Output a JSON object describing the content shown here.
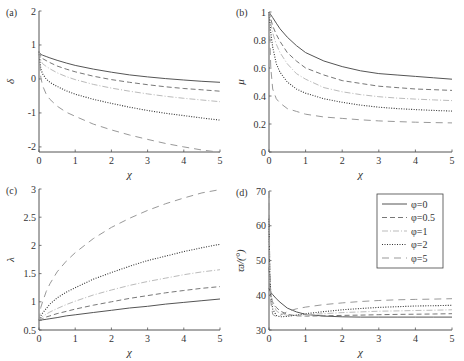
{
  "chart_data": [
    {
      "panel": "(a)",
      "type": "line",
      "xlabel": "χ",
      "ylabel": "δ",
      "xlim": [
        0,
        5
      ],
      "ylim": [
        -2.15,
        2
      ],
      "xticks": [
        0,
        1,
        2,
        3,
        4,
        5
      ],
      "yticks": [
        -2,
        -1,
        0,
        1,
        2
      ],
      "x": [
        0,
        0.05,
        0.1,
        0.2,
        0.3,
        0.5,
        0.75,
        1,
        1.5,
        2,
        2.5,
        3,
        3.5,
        4,
        4.5,
        5
      ],
      "series": [
        {
          "name": "φ=0",
          "values": [
            0.8,
            0.72,
            0.7,
            0.66,
            0.62,
            0.55,
            0.47,
            0.4,
            0.29,
            0.2,
            0.12,
            0.06,
            0.01,
            -0.03,
            -0.07,
            -0.1
          ]
        },
        {
          "name": "φ=0.5",
          "values": [
            0.8,
            0.65,
            0.6,
            0.54,
            0.48,
            0.38,
            0.29,
            0.21,
            0.08,
            -0.02,
            -0.1,
            -0.17,
            -0.23,
            -0.28,
            -0.32,
            -0.36
          ]
        },
        {
          "name": "φ=1",
          "values": [
            0.8,
            0.55,
            0.45,
            0.37,
            0.3,
            0.18,
            0.07,
            -0.02,
            -0.16,
            -0.27,
            -0.36,
            -0.44,
            -0.51,
            -0.57,
            -0.62,
            -0.67
          ]
        },
        {
          "name": "φ=2",
          "values": [
            0.8,
            0.3,
            0.15,
            0.0,
            -0.1,
            -0.22,
            -0.35,
            -0.45,
            -0.6,
            -0.72,
            -0.83,
            -0.93,
            -1.01,
            -1.08,
            -1.15,
            -1.21
          ]
        },
        {
          "name": "φ=5",
          "values": [
            0.8,
            0.05,
            -0.2,
            -0.45,
            -0.6,
            -0.8,
            -0.98,
            -1.1,
            -1.33,
            -1.5,
            -1.65,
            -1.78,
            -1.9,
            -2.0,
            -2.09,
            -2.16
          ]
        }
      ]
    },
    {
      "panel": "(b)",
      "type": "line",
      "xlabel": "χ",
      "ylabel": "μ",
      "xlim": [
        0,
        5
      ],
      "ylim": [
        0,
        1
      ],
      "xticks": [
        0,
        1,
        2,
        3,
        4,
        5
      ],
      "yticks": [
        0,
        0.2,
        0.4,
        0.6,
        0.8,
        1
      ],
      "x": [
        0,
        0.05,
        0.1,
        0.2,
        0.3,
        0.5,
        0.75,
        1,
        1.5,
        2,
        2.5,
        3,
        3.5,
        4,
        4.5,
        5
      ],
      "series": [
        {
          "name": "φ=0",
          "values": [
            1.0,
            0.98,
            0.96,
            0.92,
            0.88,
            0.82,
            0.76,
            0.71,
            0.65,
            0.61,
            0.58,
            0.56,
            0.55,
            0.54,
            0.53,
            0.52
          ]
        },
        {
          "name": "φ=0.5",
          "values": [
            1.0,
            0.95,
            0.9,
            0.84,
            0.79,
            0.71,
            0.65,
            0.6,
            0.55,
            0.51,
            0.49,
            0.47,
            0.46,
            0.45,
            0.445,
            0.44
          ]
        },
        {
          "name": "φ=1",
          "values": [
            1.0,
            0.92,
            0.85,
            0.77,
            0.71,
            0.63,
            0.56,
            0.52,
            0.46,
            0.43,
            0.41,
            0.395,
            0.385,
            0.378,
            0.372,
            0.367
          ]
        },
        {
          "name": "φ=2",
          "values": [
            1.0,
            0.85,
            0.75,
            0.63,
            0.57,
            0.5,
            0.45,
            0.42,
            0.38,
            0.355,
            0.335,
            0.32,
            0.31,
            0.303,
            0.297,
            0.292
          ]
        },
        {
          "name": "φ=5",
          "values": [
            1.0,
            0.6,
            0.45,
            0.38,
            0.35,
            0.31,
            0.29,
            0.27,
            0.25,
            0.24,
            0.23,
            0.222,
            0.217,
            0.213,
            0.21,
            0.208
          ]
        }
      ]
    },
    {
      "panel": "(c)",
      "type": "line",
      "xlabel": "χ",
      "ylabel": "λ",
      "xlim": [
        0,
        5
      ],
      "ylim": [
        0.5,
        3
      ],
      "xticks": [
        0,
        1,
        2,
        3,
        4,
        5
      ],
      "yticks": [
        0.5,
        1,
        1.5,
        2,
        2.5,
        3
      ],
      "x": [
        0,
        0.05,
        0.1,
        0.2,
        0.3,
        0.5,
        0.75,
        1,
        1.5,
        2,
        2.5,
        3,
        3.5,
        4,
        4.5,
        5
      ],
      "series": [
        {
          "name": "φ=0",
          "values": [
            0.67,
            0.67,
            0.68,
            0.69,
            0.7,
            0.72,
            0.75,
            0.77,
            0.81,
            0.85,
            0.89,
            0.92,
            0.96,
            0.99,
            1.02,
            1.05
          ]
        },
        {
          "name": "φ=0.5",
          "values": [
            0.67,
            0.69,
            0.7,
            0.73,
            0.75,
            0.79,
            0.83,
            0.87,
            0.94,
            1.0,
            1.06,
            1.11,
            1.16,
            1.2,
            1.24,
            1.27
          ]
        },
        {
          "name": "φ=1",
          "values": [
            0.67,
            0.71,
            0.74,
            0.78,
            0.82,
            0.88,
            0.95,
            1.01,
            1.12,
            1.21,
            1.29,
            1.36,
            1.42,
            1.48,
            1.53,
            1.57
          ]
        },
        {
          "name": "φ=2",
          "values": [
            0.67,
            0.75,
            0.8,
            0.88,
            0.96,
            1.07,
            1.17,
            1.25,
            1.4,
            1.52,
            1.63,
            1.73,
            1.81,
            1.89,
            1.96,
            2.02
          ]
        },
        {
          "name": "φ=5",
          "values": [
            0.67,
            0.9,
            1.0,
            1.18,
            1.32,
            1.53,
            1.72,
            1.87,
            2.12,
            2.32,
            2.48,
            2.62,
            2.74,
            2.84,
            2.93,
            2.99
          ]
        }
      ]
    },
    {
      "panel": "(d)",
      "type": "line",
      "xlabel": "χ",
      "ylabel": "ϖ/(°)",
      "xlim": [
        0,
        5
      ],
      "ylim": [
        30,
        70
      ],
      "xticks": [
        0,
        1,
        2,
        3,
        4,
        5
      ],
      "yticks": [
        30,
        40,
        50,
        60,
        70
      ],
      "x": [
        0,
        0.02,
        0.05,
        0.1,
        0.2,
        0.3,
        0.5,
        0.75,
        1,
        1.5,
        2,
        2.5,
        3,
        3.5,
        4,
        4.5,
        5
      ],
      "series": [
        {
          "name": "φ=0",
          "values": [
            42,
            41.5,
            40.8,
            40.2,
            39,
            38,
            36.3,
            35.2,
            34.5,
            34,
            33.8,
            33.7,
            33.7,
            33.7,
            33.7,
            33.7,
            33.7
          ]
        },
        {
          "name": "φ=0.5",
          "values": [
            48,
            44,
            40,
            38,
            36.5,
            35.5,
            34.5,
            34.1,
            34.0,
            34.1,
            34.2,
            34.3,
            34.4,
            34.5,
            34.55,
            34.6,
            34.7
          ]
        },
        {
          "name": "φ=1",
          "values": [
            55,
            46,
            41,
            38,
            35.5,
            34.8,
            34.2,
            34.2,
            34.4,
            34.7,
            35.0,
            35.2,
            35.4,
            35.5,
            35.6,
            35.7,
            35.8
          ]
        },
        {
          "name": "φ=2",
          "values": [
            62,
            48,
            40,
            36,
            34.2,
            33.8,
            33.9,
            34.3,
            34.7,
            35.3,
            35.8,
            36.2,
            36.5,
            36.7,
            36.9,
            37.0,
            37.1
          ]
        },
        {
          "name": "φ=5",
          "values": [
            70,
            50,
            38,
            34.5,
            33.8,
            34.2,
            35.3,
            36.1,
            36.6,
            37.3,
            37.8,
            38.2,
            38.5,
            38.7,
            38.8,
            38.9,
            39.0
          ]
        }
      ]
    }
  ],
  "legend": {
    "items": [
      {
        "label": "φ=0",
        "style": "solid",
        "color": "#555555"
      },
      {
        "label": "φ=0.5",
        "style": "dashed",
        "color": "#777777"
      },
      {
        "label": "φ=1",
        "style": "dashdot",
        "color": "#bbbbbb"
      },
      {
        "label": "φ=2",
        "style": "dotted",
        "color": "#333333"
      },
      {
        "label": "φ=5",
        "style": "dashed-long",
        "color": "#999999"
      }
    ]
  },
  "panels": [
    {
      "label": "(a)",
      "ylabel": "δ",
      "xlabel": "χ"
    },
    {
      "label": "(b)",
      "ylabel": "μ",
      "xlabel": "χ"
    },
    {
      "label": "(c)",
      "ylabel": "λ",
      "xlabel": "χ"
    },
    {
      "label": "(d)",
      "ylabel": "ϖ/(°)",
      "xlabel": "χ"
    }
  ],
  "colors": {
    "axis": "#555555",
    "text": "#333333",
    "background": "#ffffff"
  }
}
